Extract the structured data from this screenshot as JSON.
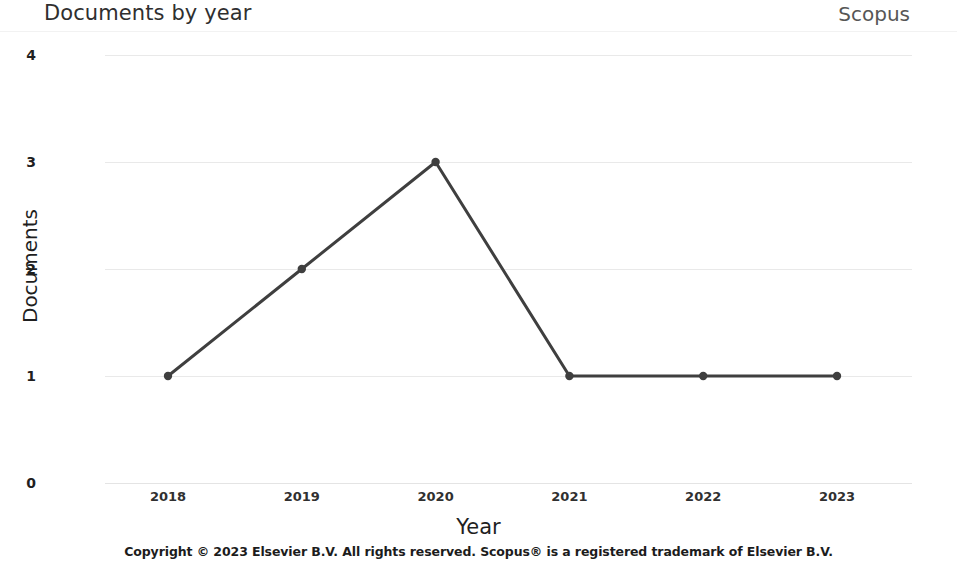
{
  "header": {
    "title": "Documents by year",
    "brand": "Scopus"
  },
  "footer": {
    "copyright": "Copyright © 2023 Elsevier B.V. All rights reserved. Scopus® is a registered trademark of Elsevier B.V."
  },
  "colors": {
    "line": "#3f3f3f",
    "marker": "#3f3f3f",
    "grid": "#e9e9e9",
    "title_text": "#2f2f2f",
    "brand_text": "#565656",
    "background": "#ffffff"
  },
  "chart_data": {
    "type": "line",
    "title": "Documents by year",
    "xlabel": "Year",
    "ylabel": "Documents",
    "categories": [
      "2018",
      "2019",
      "2020",
      "2021",
      "2022",
      "2023"
    ],
    "x": [
      2018,
      2019,
      2020,
      2021,
      2022,
      2023
    ],
    "values": [
      1,
      2,
      3,
      1,
      1,
      1
    ],
    "series": [
      {
        "name": "Documents",
        "values": [
          1,
          2,
          3,
          1,
          1,
          1
        ]
      }
    ],
    "yticks": [
      "0",
      "1",
      "2",
      "3",
      "4"
    ],
    "ytick_values": [
      0,
      1,
      2,
      3,
      4
    ],
    "xtick_labels": [
      "2018",
      "2019",
      "2020",
      "2021",
      "2022",
      "2023"
    ],
    "ylim": [
      0,
      4
    ],
    "xlim": [
      2018,
      2023
    ],
    "grid": "horizontal",
    "legend": "none",
    "markers": true
  }
}
